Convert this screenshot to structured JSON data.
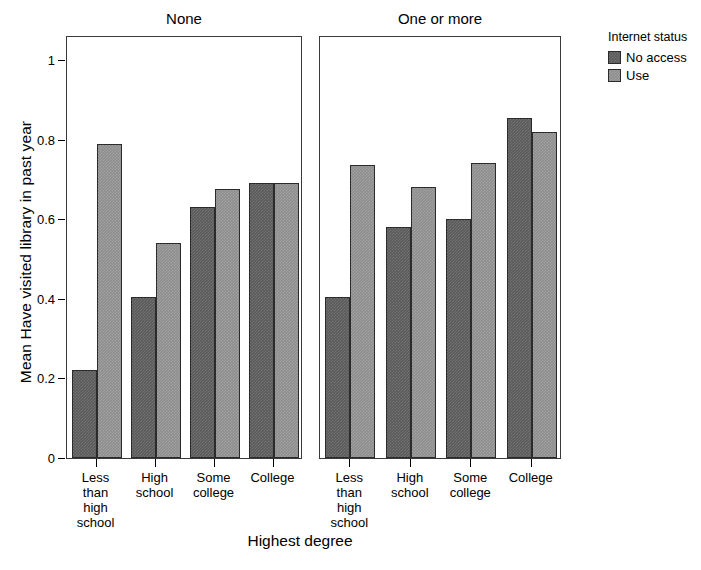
{
  "chart_data": {
    "type": "bar",
    "title": "",
    "xlabel": "Highest degree",
    "ylabel": "Mean Have visited library in past year",
    "ylim": [
      0,
      1
    ],
    "ytick_labels": [
      "1",
      "0.8",
      "0.6",
      "0.4",
      "0.2",
      "0"
    ],
    "ytick_values": [
      1,
      0.8,
      0.6,
      0.4,
      0.2,
      0
    ],
    "grid": false,
    "legend_position": "right",
    "legend_title": "Internet status",
    "categories": [
      "Less\nthan\nhigh\nschool",
      "High\nschool",
      "Some\ncollege",
      "College"
    ],
    "category_labels": [
      [
        "Less",
        "than",
        "high",
        "school"
      ],
      [
        "High",
        "school"
      ],
      [
        "Some",
        "college"
      ],
      [
        "College"
      ]
    ],
    "facets": [
      {
        "label": "None",
        "series": [
          {
            "name": "No access",
            "color": "#5a5a5a",
            "values": [
              0.22,
              0.405,
              0.63,
              0.69
            ]
          },
          {
            "name": "Use",
            "color": "#8d8d8d",
            "values": [
              0.79,
              0.54,
              0.675,
              0.69
            ]
          }
        ]
      },
      {
        "label": "One or more",
        "series": [
          {
            "name": "No access",
            "color": "#5a5a5a",
            "values": [
              0.405,
              0.58,
              0.6,
              0.855
            ]
          },
          {
            "name": "Use",
            "color": "#8d8d8d",
            "values": [
              0.735,
              0.68,
              0.74,
              0.82
            ]
          }
        ]
      }
    ],
    "series_names": [
      "No access",
      "Use"
    ],
    "colors": {
      "no_access": "#5a5a5a",
      "use": "#8d8d8d",
      "axis": "#000000",
      "panel_border": "#3a3a3a"
    }
  }
}
